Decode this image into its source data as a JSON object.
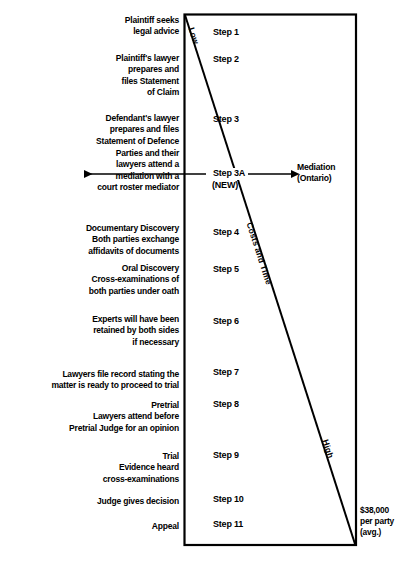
{
  "diagram": {
    "type": "flow-timeline",
    "box": {
      "stroke_color": "#000000"
    },
    "diagonal": {
      "label_start": "Low",
      "label_middle": "Costs and Time",
      "label_end": "High"
    },
    "steps": [
      {
        "id": "step-1",
        "label": "Step 1",
        "description": "Plaintiff seeks\nlegal advice"
      },
      {
        "id": "step-2",
        "label": "Step 2",
        "description": "Plaintiff's lawyer\nprepares and\nfiles Statement\nof Claim"
      },
      {
        "id": "step-3",
        "label": "Step 3",
        "description": "Defendant's lawyer\nprepares and files\nStatement of Defence"
      },
      {
        "id": "step-3a",
        "label": "Step 3A",
        "sublabel": "(NEW)",
        "description": "Parties and their\nlawyers attend a\nmediation with a\ncourt roster mediator",
        "right_note": "Mediation\n(Ontario)"
      },
      {
        "id": "step-4",
        "label": "Step 4",
        "description": "Documentary Discovery\nBoth parties exchange\naffidavits of documents"
      },
      {
        "id": "step-5",
        "label": "Step 5",
        "description": "Oral Discovery\nCross-examinations of\nboth parties under oath"
      },
      {
        "id": "step-6",
        "label": "Step 6",
        "description": "Experts will have been\nretained by both sides\nif necessary"
      },
      {
        "id": "step-7",
        "label": "Step 7",
        "description": "Lawyers file record stating the\nmatter is ready to proceed to trial"
      },
      {
        "id": "step-8",
        "label": "Step 8",
        "description": "Pretrial\nLawyers attend before\nPretrial Judge for an opinion"
      },
      {
        "id": "step-9",
        "label": "Step 9",
        "description": "Trial\nEvidence heard\ncross-examinations"
      },
      {
        "id": "step-10",
        "label": "Step 10",
        "description": "Judge gives decision"
      },
      {
        "id": "step-11",
        "label": "Step 11",
        "description": "Appeal"
      }
    ],
    "cost_note": "$38,000\nper party\n(avg.)"
  }
}
